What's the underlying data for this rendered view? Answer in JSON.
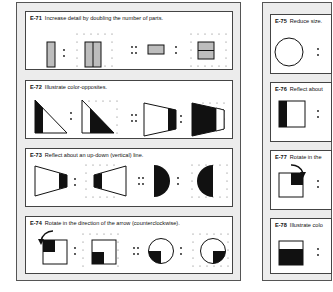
{
  "left_page": {
    "exercises": [
      {
        "id": "E-71",
        "instruction": "Increase detail by doubling the number of parts."
      },
      {
        "id": "E-72",
        "instruction": "Illustrate color-opposites."
      },
      {
        "id": "E-73",
        "instruction": "Reflect about an up-down (vertical) line."
      },
      {
        "id": "E-74",
        "instruction": "Rotate in the direction of the arrow (counterclockwise)."
      }
    ]
  },
  "right_page": {
    "exercises": [
      {
        "id": "E-75",
        "instruction": "Reduce size."
      },
      {
        "id": "E-76",
        "instruction": "Reflect about"
      },
      {
        "id": "E-77",
        "instruction": "Rotate in the"
      },
      {
        "id": "E-78",
        "instruction": "Illustrate colo"
      }
    ]
  },
  "colors": {
    "panel_bg": "#ececec",
    "card_bg": "#ffffff",
    "shape_fill": "#bdbdbd",
    "ink": "#111111"
  }
}
